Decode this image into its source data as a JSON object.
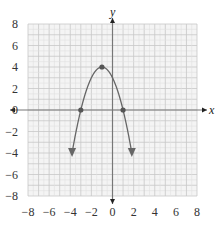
{
  "chart_data": {
    "type": "line",
    "title": "",
    "xlabel": "x",
    "ylabel": "y",
    "xlim": [
      -8,
      8
    ],
    "ylim": [
      -8,
      8
    ],
    "grid": true,
    "grid_minor_step": 1,
    "x_ticks": [
      -8,
      -6,
      -4,
      -2,
      0,
      2,
      4,
      6,
      8
    ],
    "y_ticks": [
      -8,
      -6,
      -4,
      -2,
      0,
      2,
      4,
      6,
      8
    ],
    "x_tick_labels": [
      "−8",
      "−6",
      "−4",
      "−2",
      "0",
      "2",
      "4",
      "6",
      "8"
    ],
    "y_tick_labels": [
      "8",
      "6",
      "4",
      "2",
      "0",
      "−2",
      "−4",
      "−6",
      "−8"
    ],
    "series": [
      {
        "name": "parabola",
        "equation": "y = -(x + 1)^2 + 4",
        "color": "#666666",
        "x_range": [
          -3.83,
          1.83
        ],
        "end_arrows": true
      }
    ],
    "points": [
      {
        "label": "vertex",
        "x": -1,
        "y": 4
      },
      {
        "label": "x-intercept",
        "x": -3,
        "y": 0
      },
      {
        "label": "x-intercept",
        "x": 1,
        "y": 0
      }
    ],
    "colors": {
      "grid_major": "#c8c8c8",
      "grid_minor": "#e0e0e0",
      "grid_background": "#f4f4f4",
      "axis": "#777777",
      "curve": "#666666"
    }
  }
}
